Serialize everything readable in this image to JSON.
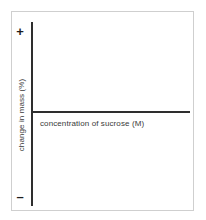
{
  "figure": {
    "background_color": "#ffffff",
    "frame_color": "#cfcfcf",
    "axis_color": "#2e2e2e",
    "text_color": "#3a3a3a"
  },
  "axes": {
    "y_label": "change in mass (%)",
    "x_label": "concentration of sucrose (M)",
    "positive_sign": "+",
    "negative_sign": "–"
  },
  "chart_data": {
    "type": "line",
    "title": "",
    "subtitle": "",
    "xlabel": "concentration of sucrose (M)",
    "ylabel": "change in mass (%)",
    "x": [],
    "series": [],
    "annotations": [
      "+",
      "–"
    ],
    "axis_tick_labels": {
      "x": [],
      "y": [
        "+",
        "–"
      ]
    },
    "grid": false,
    "legend": "none",
    "xlim": [
      0,
      1
    ],
    "ylim": [
      -1,
      1
    ]
  }
}
